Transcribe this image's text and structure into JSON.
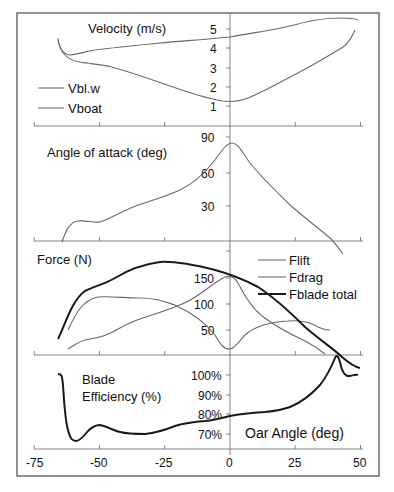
{
  "chart_data": [
    {
      "type": "line",
      "title": "Velocity (m/s)",
      "xlabel": "Oar Angle (deg)",
      "ylabel": "Velocity (m/s)",
      "yticks": [
        1,
        2,
        3,
        4,
        5
      ],
      "legend_position": "lower-left",
      "x": [
        -65,
        -62,
        -58,
        -50,
        -40,
        -30,
        -20,
        -10,
        0,
        10,
        20,
        30,
        40,
        45,
        48
      ],
      "series": [
        {
          "name": "Vbl.w",
          "values": [
            4.6,
            3.9,
            3.65,
            3.95,
            4.05,
            4.2,
            4.35,
            4.45,
            4.6,
            4.85,
            5.05,
            5.25,
            5.5,
            5.55,
            5.5
          ]
        },
        {
          "name": "Vboat",
          "values": [
            4.5,
            3.6,
            3.3,
            3.15,
            2.85,
            2.45,
            1.95,
            1.5,
            1.25,
            1.5,
            2.2,
            2.9,
            3.75,
            4.1,
            4.9
          ]
        }
      ]
    },
    {
      "type": "line",
      "title": "Angle of attack (deg)",
      "xlabel": "Oar Angle (deg)",
      "ylabel": "Angle of attack (deg)",
      "yticks": [
        30,
        60,
        90
      ],
      "x": [
        -62,
        -58,
        -55,
        -50,
        -45,
        -40,
        -35,
        -30,
        -25,
        -20,
        -15,
        -10,
        -5,
        0,
        2,
        5,
        10,
        15,
        20,
        25,
        30,
        35,
        40
      ],
      "series": [
        {
          "name": "Angle of attack",
          "values": [
            0,
            14,
            18,
            17,
            18,
            23,
            29,
            34,
            36,
            40,
            44,
            48,
            62,
            85,
            85,
            74,
            58,
            46,
            36,
            26,
            16,
            4,
            -8
          ]
        }
      ]
    },
    {
      "type": "line",
      "title": "Force (N)",
      "xlabel": "Oar Angle (deg)",
      "ylabel": "Force (N)",
      "yticks": [
        50,
        100,
        150
      ],
      "legend_position": "upper-right",
      "x": [
        -65,
        -60,
        -55,
        -50,
        -45,
        -40,
        -35,
        -30,
        -25,
        -20,
        -15,
        -10,
        -5,
        0,
        5,
        10,
        15,
        20,
        25,
        30,
        35,
        40,
        45,
        48
      ],
      "series": [
        {
          "name": "Flift",
          "values": [
            null,
            50,
            95,
            112,
            110,
            108,
            108,
            107,
            103,
            95,
            85,
            70,
            45,
            15,
            45,
            60,
            64,
            66,
            66,
            64,
            58,
            54,
            null,
            null
          ]
        },
        {
          "name": "Fdrag",
          "values": [
            null,
            15,
            30,
            35,
            45,
            60,
            72,
            82,
            90,
            98,
            110,
            122,
            140,
            150,
            112,
            80,
            60,
            45,
            32,
            20,
            10,
            0,
            null,
            null
          ]
        },
        {
          "name": "Fblade total",
          "values": [
            30,
            85,
            140,
            150,
            160,
            175,
            185,
            190,
            190,
            186,
            178,
            170,
            162,
            155,
            145,
            132,
            115,
            98,
            82,
            65,
            50,
            30,
            12,
            0
          ]
        }
      ]
    },
    {
      "type": "line",
      "title": "Blade Efficiency (%)",
      "xlabel": "Oar Angle (deg)",
      "ylabel": "Blade Efficiency (%)",
      "yticks": [
        "70%",
        "80%",
        "90%",
        "100%"
      ],
      "xticks": [
        -75,
        -50,
        -25,
        0,
        25,
        50
      ],
      "xlim": [
        -75,
        50
      ],
      "x": [
        -66,
        -65,
        -63,
        -61,
        -59,
        -57,
        -54,
        -50,
        -45,
        -40,
        -35,
        -30,
        -25,
        -20,
        -15,
        -10,
        -5,
        0,
        5,
        10,
        15,
        20,
        25,
        30,
        35,
        38,
        40,
        41,
        43,
        45,
        47,
        48
      ],
      "series": [
        {
          "name": "Blade Efficiency",
          "values": [
            103,
            103,
            85,
            72,
            68,
            68,
            72,
            76,
            75,
            72,
            71,
            71,
            72,
            74,
            76,
            77,
            78,
            79,
            80,
            80.5,
            81,
            83,
            87,
            93,
            100,
            105,
            110,
            112,
            108,
            102,
            102,
            103
          ]
        }
      ]
    }
  ],
  "panels": {
    "velocity": {
      "title": "Velocity (m/s)",
      "ticks": [
        "5",
        "4",
        "3",
        "2",
        "1"
      ],
      "legend": [
        "Vbl.w",
        "Vboat"
      ]
    },
    "aoa": {
      "title": "Angle of attack (deg)",
      "ticks": [
        "90",
        "60",
        "30"
      ]
    },
    "force": {
      "title": "Force (N)",
      "ticks": [
        "150",
        "100",
        "50"
      ],
      "legend": [
        "Flift",
        "Fdrag",
        "Fblade total"
      ]
    },
    "efficiency": {
      "title_line1": "Blade",
      "title_line2": "Efficiency (%)",
      "ticks": [
        "100%",
        "90%",
        "80%",
        "70%"
      ]
    }
  },
  "x_axis": {
    "label": "Oar Angle (deg)",
    "ticks": [
      "-75",
      "-50",
      "-25",
      "0",
      "25",
      "50"
    ]
  }
}
